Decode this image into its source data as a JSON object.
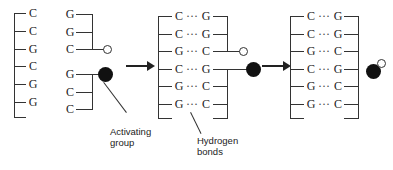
{
  "figure": {
    "labels": {
      "activating_group": "Activating\ngroup",
      "activating_group_line1": "Activating",
      "activating_group_line2": "group",
      "hydrogen_bonds_line1": "Hydrogen",
      "hydrogen_bonds_line2": "bonds"
    },
    "colors": {
      "ink": "#222222",
      "line": "#333333",
      "filled_circle": "#111111",
      "open_circle_fill": "#ffffff",
      "background": "#ffffff"
    },
    "symbols": {
      "hydrogen_bond_glyph": "···",
      "activating_group_icon": "filled-circle-icon",
      "free_end_icon": "open-circle-icon",
      "arrow_icon": "right-arrow-icon"
    }
  },
  "panels": [
    {
      "id": "panel-left",
      "name": "template-and-fragments",
      "template_strand": {
        "name": "template-strand",
        "bases": [
          "C",
          "C",
          "G",
          "C",
          "G",
          "G"
        ]
      },
      "fragments": [
        {
          "id": "fragment-top",
          "name": "oligonucleotide-fragment-top",
          "bases": [
            "G",
            "G",
            "C"
          ],
          "end_group": "open-circle"
        },
        {
          "id": "fragment-bottom",
          "name": "oligonucleotide-fragment-bottom",
          "bases": [
            "G",
            "C",
            "C"
          ],
          "end_group": "filled-circle"
        }
      ]
    },
    {
      "id": "panel-middle",
      "name": "hybridized-duplex",
      "pairs": [
        {
          "left": "C",
          "bond": "···",
          "right": "G"
        },
        {
          "left": "C",
          "bond": "···",
          "right": "G"
        },
        {
          "left": "G",
          "bond": "···",
          "right": "C"
        },
        {
          "left": "C",
          "bond": "···",
          "right": "G"
        },
        {
          "left": "G",
          "bond": "···",
          "right": "C"
        },
        {
          "left": "G",
          "bond": "···",
          "right": "C"
        }
      ],
      "markers": [
        {
          "row": 3,
          "type": "open-circle"
        },
        {
          "row": 4,
          "type": "filled-circle"
        }
      ]
    },
    {
      "id": "panel-right",
      "name": "ligated-duplex",
      "pairs": [
        {
          "left": "C",
          "bond": "···",
          "right": "G"
        },
        {
          "left": "C",
          "bond": "···",
          "right": "G"
        },
        {
          "left": "G",
          "bond": "···",
          "right": "C"
        },
        {
          "left": "C",
          "bond": "···",
          "right": "G"
        },
        {
          "left": "G",
          "bond": "···",
          "right": "C"
        },
        {
          "left": "G",
          "bond": "···",
          "right": "C"
        }
      ],
      "released_group": {
        "name": "released-activating-group",
        "filled": "filled-circle",
        "open": "open-circle"
      }
    }
  ],
  "arrows": [
    {
      "id": "arrow-1",
      "name": "reaction-arrow-1"
    },
    {
      "id": "arrow-2",
      "name": "reaction-arrow-2"
    }
  ]
}
